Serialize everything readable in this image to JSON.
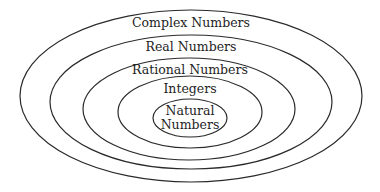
{
  "diagram": {
    "type": "nested-sets",
    "sets": [
      {
        "id": "complex",
        "label": "Complex Numbers",
        "cx": 191,
        "cy": 96,
        "rx": 171,
        "ry": 86,
        "label_y": 27
      },
      {
        "id": "real",
        "label": "Real Numbers",
        "cx": 191,
        "cy": 102,
        "rx": 141,
        "ry": 67,
        "label_y": 51
      },
      {
        "id": "rational",
        "label": "Rational Numbers",
        "cx": 189,
        "cy": 109,
        "rx": 106,
        "ry": 51,
        "label_y": 74
      },
      {
        "id": "integers",
        "label": "Integers",
        "cx": 190,
        "cy": 112,
        "rx": 72,
        "ry": 36,
        "label_y": 93
      },
      {
        "id": "natural",
        "label_line1": "Natural",
        "label_line2": "Numbers",
        "cx": 190,
        "cy": 118,
        "rx": 37,
        "ry": 19,
        "label_y1": 115,
        "label_y2": 129
      }
    ]
  }
}
